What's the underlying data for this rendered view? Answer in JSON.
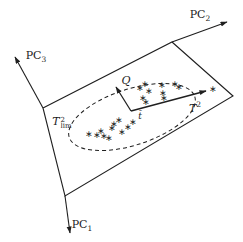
{
  "figure": {
    "type": "pca-geometry-diagram",
    "colors": {
      "line": "#1f1f1f",
      "marker": "#1f1f1f",
      "background": "#ffffff"
    },
    "marker_symbol": "∗",
    "labels": {
      "pc1": {
        "base": "PC",
        "sub": "1"
      },
      "pc2": {
        "base": "PC",
        "sub": "2"
      },
      "pc3": {
        "base": "PC",
        "sub": "3"
      },
      "q": {
        "base": "Q"
      },
      "t2": {
        "base": "T",
        "sup": "2"
      },
      "t2lim": {
        "base": "T",
        "sup": "2",
        "sub": "lim"
      },
      "tbar": {
        "base": "t̄"
      }
    },
    "geometry": {
      "plane": [
        [
          43,
          108
        ],
        [
          172,
          42
        ],
        [
          233,
          96
        ],
        [
          65,
          196
        ]
      ],
      "axes": [
        {
          "name": "pc2-axis",
          "from": [
            172,
            42
          ],
          "to": [
            227,
            22
          ]
        },
        {
          "name": "pc3-axis",
          "from": [
            43,
            108
          ],
          "to": [
            15,
            57
          ]
        },
        {
          "name": "pc1-axis",
          "from": [
            65,
            196
          ],
          "to": [
            70,
            233
          ]
        }
      ],
      "vectors": [
        {
          "name": "q-vector",
          "from": [
            131,
            111
          ],
          "to": [
            116,
            87
          ]
        },
        {
          "name": "t2-vector",
          "from": [
            131,
            111
          ],
          "to": [
            206,
            91
          ]
        }
      ],
      "ellipse": {
        "cx": 132,
        "cy": 117,
        "rx": 66,
        "ry": 28,
        "rotation": -18,
        "dash": "4 3"
      },
      "points": [
        [
          89,
          134
        ],
        [
          97,
          135
        ],
        [
          101,
          131
        ],
        [
          104,
          136
        ],
        [
          109,
          138
        ],
        [
          112,
          128
        ],
        [
          114,
          124
        ],
        [
          119,
          120
        ],
        [
          122,
          132
        ],
        [
          128,
          127
        ],
        [
          133,
          122
        ],
        [
          140,
          88
        ],
        [
          145,
          84
        ],
        [
          143,
          98
        ],
        [
          149,
          91
        ],
        [
          146,
          102
        ],
        [
          162,
          85
        ],
        [
          163,
          93
        ],
        [
          164,
          98
        ],
        [
          175,
          84
        ],
        [
          179,
          87
        ]
      ],
      "outlier": [
        213,
        89
      ]
    }
  }
}
